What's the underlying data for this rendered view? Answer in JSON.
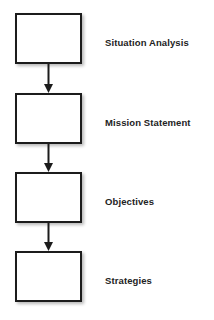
{
  "diagram": {
    "orientation": "vertical-top-down",
    "background_color": "#ffffff",
    "box_border_color": "#1c1c1c",
    "box_fill_color": "#ffffff",
    "arrow_color": "#1c1c1c",
    "label_color": "#232323",
    "nodes": [
      {
        "id": "node-1",
        "label": "Situation Analysis",
        "box_text": ""
      },
      {
        "id": "node-2",
        "label": "Mission Statement",
        "box_text": ""
      },
      {
        "id": "node-3",
        "label": "Objectives",
        "box_text": ""
      },
      {
        "id": "node-4",
        "label": "Strategies",
        "box_text": ""
      }
    ],
    "connectors": [
      {
        "id": "connector-1",
        "from": "node-1",
        "to": "node-2",
        "style": "arrow-down"
      },
      {
        "id": "connector-2",
        "from": "node-2",
        "to": "node-3",
        "style": "arrow-down"
      },
      {
        "id": "connector-3",
        "from": "node-3",
        "to": "node-4",
        "style": "arrow-down"
      }
    ]
  }
}
